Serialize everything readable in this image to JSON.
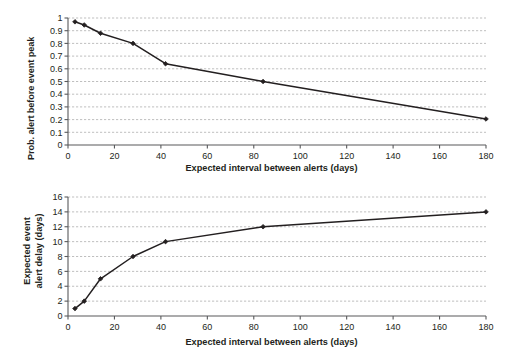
{
  "figure": {
    "background": "#ffffff",
    "line_color": "#231f20",
    "grid_color": "#b8b8b8",
    "axis_color": "#58595b",
    "marker_color": "#231f20"
  },
  "chart_data": [
    {
      "type": "line",
      "panel": "top",
      "title": "",
      "xlabel": "Expected interval between alerts (days)",
      "ylabel": "Prob. alert before event peak",
      "xlim": [
        0,
        180
      ],
      "ylim": [
        0,
        1
      ],
      "xticks": [
        0,
        20,
        40,
        60,
        80,
        100,
        120,
        140,
        160,
        180
      ],
      "xticklabels": [
        "0",
        "20",
        "40",
        "60",
        "80",
        "100",
        "120",
        "140",
        "160",
        "180"
      ],
      "yticks": [
        0,
        0.1,
        0.2,
        0.3,
        0.4,
        0.5,
        0.6,
        0.7,
        0.8,
        0.9,
        1
      ],
      "yticklabels": [
        "0",
        "0.1",
        "0.2",
        "0.3",
        "0.4",
        "0.5",
        "0.6",
        "0.7",
        "0.8",
        "0.9",
        "1"
      ],
      "grid": "horizontal-dashed",
      "legend": "none",
      "markers": "diamond",
      "x": [
        3,
        7,
        14,
        28,
        42,
        84,
        180
      ],
      "y": [
        0.97,
        0.945,
        0.88,
        0.8,
        0.64,
        0.5,
        0.205
      ]
    },
    {
      "type": "line",
      "panel": "bottom",
      "title": "",
      "xlabel": "Expected interval between alerts (days)",
      "ylabel": "Expected event alert delay (days)",
      "ylabel_line1": "Expected event",
      "ylabel_line2": "alert delay (days)",
      "xlim": [
        0,
        180
      ],
      "ylim": [
        0,
        16
      ],
      "xticks": [
        0,
        20,
        40,
        60,
        80,
        100,
        120,
        140,
        160,
        180
      ],
      "xticklabels": [
        "0",
        "20",
        "40",
        "60",
        "80",
        "100",
        "120",
        "140",
        "160",
        "180"
      ],
      "yticks": [
        0,
        2,
        4,
        6,
        8,
        10,
        12,
        14,
        16
      ],
      "yticklabels": [
        "0",
        "2",
        "4",
        "6",
        "8",
        "10",
        "12",
        "14",
        "16"
      ],
      "grid": "horizontal-dashed",
      "legend": "none",
      "markers": "diamond",
      "x": [
        3,
        7,
        14,
        28,
        42,
        84,
        180
      ],
      "y": [
        1,
        2,
        5,
        8,
        10,
        12,
        14
      ]
    }
  ]
}
